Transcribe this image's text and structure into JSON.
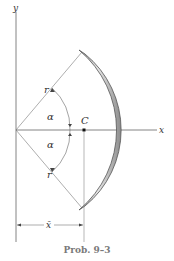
{
  "figure": {
    "caption": "Prob. 9–3",
    "axes": {
      "x_label": "x",
      "y_label": "y"
    },
    "labels": {
      "radius_upper": "r",
      "radius_lower": "r",
      "angle_upper": "α",
      "angle_lower": "α",
      "centroid": "C",
      "centroid_distance": "x̄"
    },
    "colors": {
      "rod_fill": "#c8c8c8",
      "rod_edge": "#666666",
      "line": "#555555",
      "caption": "#7a7a7a"
    }
  }
}
